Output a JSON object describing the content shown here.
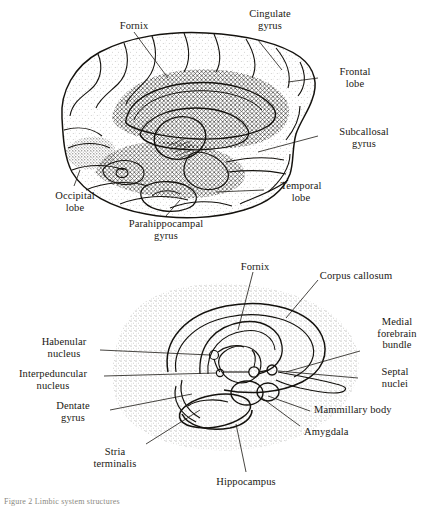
{
  "figure": {
    "caption": "Figure 2  Limbic system structures",
    "panels": [
      {
        "id": "upper",
        "name": "medial-brain-view",
        "title": "Medial view of the human brain",
        "labels": [
          {
            "id": "fornix",
            "text": "Fornix"
          },
          {
            "id": "cingulate-gyrus",
            "text": "Cingulate\ngyrus"
          },
          {
            "id": "frontal-lobe",
            "text": "Frontal\nlobe"
          },
          {
            "id": "subcallosal-gyrus",
            "text": "Subcallosal\ngyrus"
          },
          {
            "id": "temporal-lobe",
            "text": "Temporal\nlobe"
          },
          {
            "id": "occipital-lobe",
            "text": "Occipital\nlobe"
          },
          {
            "id": "parahippocampal-gyrus",
            "text": "Parahippocampal\ngyrus"
          }
        ]
      },
      {
        "id": "lower",
        "name": "limbic-system-schematic",
        "title": "Limbic system structures schematic",
        "labels": [
          {
            "id": "fornix",
            "text": "Fornix"
          },
          {
            "id": "corpus-callosum",
            "text": "Corpus callosum"
          },
          {
            "id": "medial-forebrain-bundle",
            "text": "Medial\nforebrain\nbundle"
          },
          {
            "id": "septal-nuclei",
            "text": "Septal\nnuclei"
          },
          {
            "id": "mammillary-body",
            "text": "Mammillary body"
          },
          {
            "id": "amygdala",
            "text": "Amygdala"
          },
          {
            "id": "habenular-nucleus",
            "text": "Habenular\nnucleus"
          },
          {
            "id": "interpeduncular-nucleus",
            "text": "Interpeduncular\nnucleus"
          },
          {
            "id": "dentate-gyrus",
            "text": "Dentate\ngyrus"
          },
          {
            "id": "stria-terminalis",
            "text": "Stria\nterminalis"
          },
          {
            "id": "hippocampus",
            "text": "Hippocampus"
          }
        ]
      }
    ]
  },
  "colors": {
    "ink": "#1a1813",
    "paper": "#ffffff",
    "caption": "#8a8880"
  }
}
